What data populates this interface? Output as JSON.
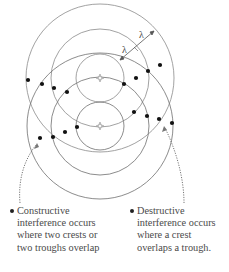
{
  "diagram": {
    "sources": [
      {
        "name": "source-a",
        "x": 100,
        "y": 78,
        "icon": "star-icon"
      },
      {
        "name": "source-b",
        "x": 100,
        "y": 126,
        "icon": "star-icon"
      }
    ],
    "wavefront_radii": [
      24,
      49,
      74
    ],
    "wavelength_labels": [
      "λ",
      "λ"
    ],
    "colors": {
      "circle": "#8a8a8a",
      "dot": "#111111",
      "text": "#4a4a4a",
      "source": "#9a9a9a"
    },
    "dots": [
      [
        28,
        80
      ],
      [
        42,
        84
      ],
      [
        54,
        88
      ],
      [
        67,
        92
      ],
      [
        148,
        71
      ],
      [
        160,
        65
      ],
      [
        136,
        78
      ],
      [
        124,
        84
      ],
      [
        77,
        127
      ],
      [
        65,
        132
      ],
      [
        53,
        137
      ],
      [
        40,
        138
      ],
      [
        134,
        112
      ],
      [
        147,
        116
      ],
      [
        159,
        119
      ],
      [
        172,
        123
      ]
    ]
  },
  "captions": {
    "constructive": {
      "lines": [
        "Constructive",
        "interference occurs",
        "where two crests or",
        "two troughs overlap"
      ]
    },
    "destructive": {
      "lines": [
        "Destructive",
        "interference occurs",
        "where a crest",
        "overlaps a trough."
      ]
    }
  }
}
